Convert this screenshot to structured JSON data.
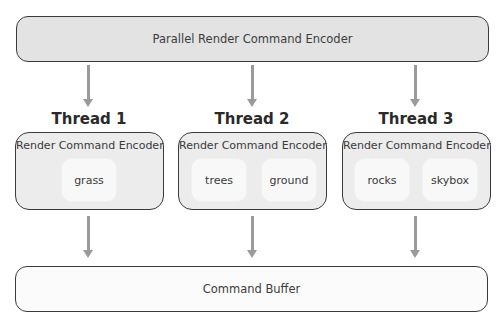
{
  "diagram": {
    "top_box": {
      "label": "Parallel Render Command Encoder"
    },
    "threads": [
      {
        "label": "Thread 1",
        "encoder_label": "Render Command Encoder",
        "items": [
          "grass"
        ]
      },
      {
        "label": "Thread 2",
        "encoder_label": "Render Command Encoder",
        "items": [
          "trees",
          "ground"
        ]
      },
      {
        "label": "Thread 3",
        "encoder_label": "Render Command Encoder",
        "items": [
          "rocks",
          "skybox"
        ]
      }
    ],
    "bottom_box": {
      "label": "Command Buffer"
    },
    "colors": {
      "top_box_fill": "#e3e3e3",
      "thread_box_fill": "#ececec",
      "item_fill": "#f8f8f8",
      "bottom_box_fill": "#fbfbfb",
      "border": "#3a3a3a",
      "arrow": "#9a9a9a"
    }
  }
}
